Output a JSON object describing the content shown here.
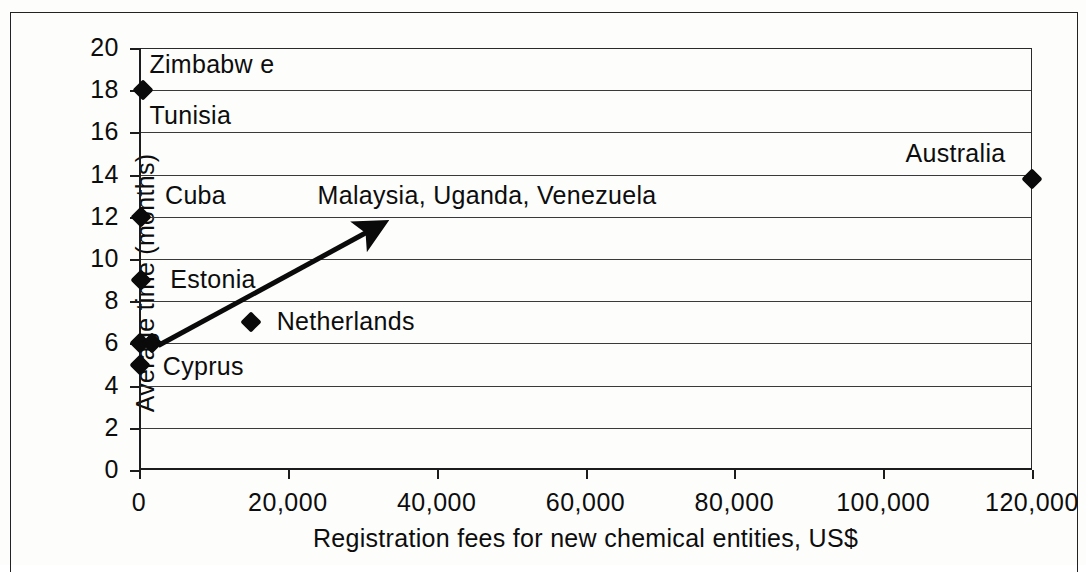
{
  "chart_data": {
    "type": "scatter",
    "title": "",
    "xlabel": "Registration fees for new chemical entities, US$",
    "ylabel": "Average time (months)",
    "xlim": [
      0,
      120000
    ],
    "ylim": [
      0,
      20
    ],
    "grid": true,
    "legend": "none",
    "xticks": [
      "0",
      "20,000",
      "40,000",
      "60,000",
      "80,000",
      "100,000",
      "120,000"
    ],
    "xtick_values": [
      0,
      20000,
      40000,
      60000,
      80000,
      100000,
      120000
    ],
    "yticks": [
      "0",
      "2",
      "4",
      "6",
      "8",
      "10",
      "12",
      "14",
      "16",
      "18",
      "20"
    ],
    "ytick_values": [
      0,
      2,
      4,
      6,
      8,
      10,
      12,
      14,
      16,
      18,
      20
    ],
    "points": [
      {
        "name": "Zimbabwe",
        "x": 500,
        "y": 18
      },
      {
        "name": "Cuba",
        "x": 300,
        "y": 12
      },
      {
        "name": "Estonia",
        "x": 300,
        "y": 9
      },
      {
        "name": "Malaysia",
        "x": 200,
        "y": 6
      },
      {
        "name": "Uganda",
        "x": 1800,
        "y": 6
      },
      {
        "name": "Cyprus",
        "x": 200,
        "y": 5
      },
      {
        "name": "Netherlands",
        "x": 15000,
        "y": 7
      },
      {
        "name": "Australia",
        "x": 120000,
        "y": 13.8
      }
    ],
    "annotations": [
      {
        "text": "Zimbabw e",
        "x": 1400,
        "y": 19.2
      },
      {
        "text": "Tunisia",
        "x": 1400,
        "y": 16.8
      },
      {
        "text": "Cuba",
        "x": 3500,
        "y": 13.0
      },
      {
        "text": "Malaysia,   Uganda,  Venezuela",
        "x": 24000,
        "y": 13.0
      },
      {
        "text": "Australia",
        "x": 103000,
        "y": 15.0
      },
      {
        "text": "Estonia",
        "x": 4200,
        "y": 9.0
      },
      {
        "text": "Netherlands",
        "x": 18500,
        "y": 7.0
      },
      {
        "text": "Cyprus",
        "x": 3200,
        "y": 4.9
      }
    ],
    "trend_arrow": {
      "from": {
        "x": 2600,
        "y": 5.9
      },
      "to": {
        "x": 30800,
        "y": 11.3
      }
    }
  }
}
